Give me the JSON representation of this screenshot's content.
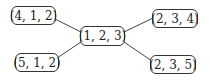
{
  "diagram": {
    "type": "tree",
    "center": {
      "id": "n123",
      "label": "(1, 2, 3)"
    },
    "nodes": [
      {
        "id": "n412",
        "label": "(4, 1, 2)"
      },
      {
        "id": "n512",
        "label": "(5, 1, 2)"
      },
      {
        "id": "n123",
        "label": "(1, 2, 3)"
      },
      {
        "id": "n234",
        "label": "(2, 3, 4)"
      },
      {
        "id": "n235",
        "label": "(2, 3, 5)"
      }
    ],
    "edges": [
      {
        "from": "n412",
        "to": "n123"
      },
      {
        "from": "n512",
        "to": "n123"
      },
      {
        "from": "n123",
        "to": "n234"
      },
      {
        "from": "n123",
        "to": "n235"
      }
    ],
    "colors": {
      "stroke": "#333333",
      "text": "#222222",
      "background": "#ffffff"
    }
  }
}
